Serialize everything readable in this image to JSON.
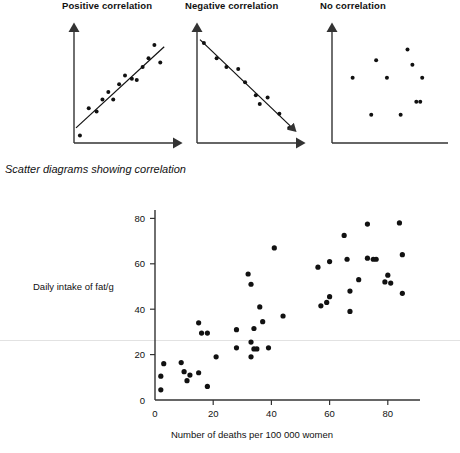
{
  "caption": "Scatter diagrams showing correlation",
  "mini_charts": [
    {
      "title": "Positive correlation",
      "type": "scatter",
      "has_trend_line": true,
      "x": [
        4,
        13,
        21,
        27,
        33,
        38,
        44,
        50,
        57,
        62,
        68,
        74,
        80,
        86
      ],
      "y": [
        5,
        30,
        27,
        38,
        45,
        38,
        52,
        60,
        57,
        56,
        68,
        76,
        88,
        72
      ],
      "xlim": [
        0,
        100
      ],
      "ylim": [
        0,
        100
      ],
      "grid": false,
      "xlabel": "",
      "ylabel": ""
    },
    {
      "title": "Negative correlation",
      "type": "scatter",
      "has_trend_line": true,
      "x": [
        5,
        18,
        28,
        40,
        47,
        58,
        62,
        70,
        82,
        92
      ],
      "y": [
        90,
        76,
        68,
        66,
        54,
        42,
        34,
        40,
        25,
        12
      ],
      "xlim": [
        0,
        100
      ],
      "ylim": [
        0,
        100
      ],
      "grid": false,
      "xlabel": "",
      "ylabel": ""
    },
    {
      "title": "No correlation",
      "type": "scatter",
      "has_trend_line": false,
      "x": [
        19,
        43,
        54,
        75,
        80,
        90,
        88,
        38,
        68,
        84
      ],
      "y": [
        58,
        74,
        58,
        84,
        70,
        58,
        36,
        24,
        24,
        36
      ],
      "xlim": [
        0,
        100
      ],
      "ylim": [
        0,
        100
      ],
      "grid": false,
      "xlabel": "",
      "ylabel": ""
    }
  ],
  "chart_data": {
    "type": "scatter",
    "title": "",
    "xlabel": "Number of deaths per 100 000 women",
    "ylabel": "Daily intake of fat/g",
    "xlim": [
      0,
      90
    ],
    "ylim": [
      0,
      88
    ],
    "xticks": [
      0,
      20,
      40,
      60,
      80
    ],
    "yticks": [
      0,
      20,
      40,
      60,
      80
    ],
    "grid": false,
    "legend": null,
    "points": [
      [
        2,
        10.5
      ],
      [
        2,
        4.5
      ],
      [
        3,
        16.0
      ],
      [
        9,
        16.5
      ],
      [
        10,
        12.5
      ],
      [
        11,
        8.5
      ],
      [
        12,
        11.0
      ],
      [
        15,
        12.0
      ],
      [
        15,
        34.0
      ],
      [
        16,
        29.5
      ],
      [
        18,
        29.5
      ],
      [
        18,
        6.0
      ],
      [
        21,
        19.0
      ],
      [
        28,
        23.0
      ],
      [
        28,
        31.0
      ],
      [
        32,
        55.5
      ],
      [
        33,
        19.0
      ],
      [
        33,
        25.5
      ],
      [
        33,
        51.0
      ],
      [
        34,
        22.5
      ],
      [
        34,
        31.5
      ],
      [
        35,
        22.5
      ],
      [
        36,
        41.0
      ],
      [
        37,
        34.5
      ],
      [
        39,
        23.0
      ],
      [
        41,
        67.0
      ],
      [
        44,
        37.0
      ],
      [
        56,
        58.5
      ],
      [
        57,
        41.5
      ],
      [
        59,
        43.0
      ],
      [
        60,
        45.5
      ],
      [
        60,
        61.0
      ],
      [
        65,
        72.5
      ],
      [
        66,
        62.0
      ],
      [
        67,
        39.0
      ],
      [
        67,
        48.0
      ],
      [
        70,
        53.0
      ],
      [
        73,
        77.5
      ],
      [
        73,
        62.5
      ],
      [
        75,
        62.0
      ],
      [
        76,
        62.0
      ],
      [
        79,
        52.0
      ],
      [
        80,
        55.0
      ],
      [
        81,
        51.5
      ],
      [
        84,
        78.0
      ],
      [
        85,
        64.0
      ],
      [
        85,
        47.0
      ]
    ]
  }
}
